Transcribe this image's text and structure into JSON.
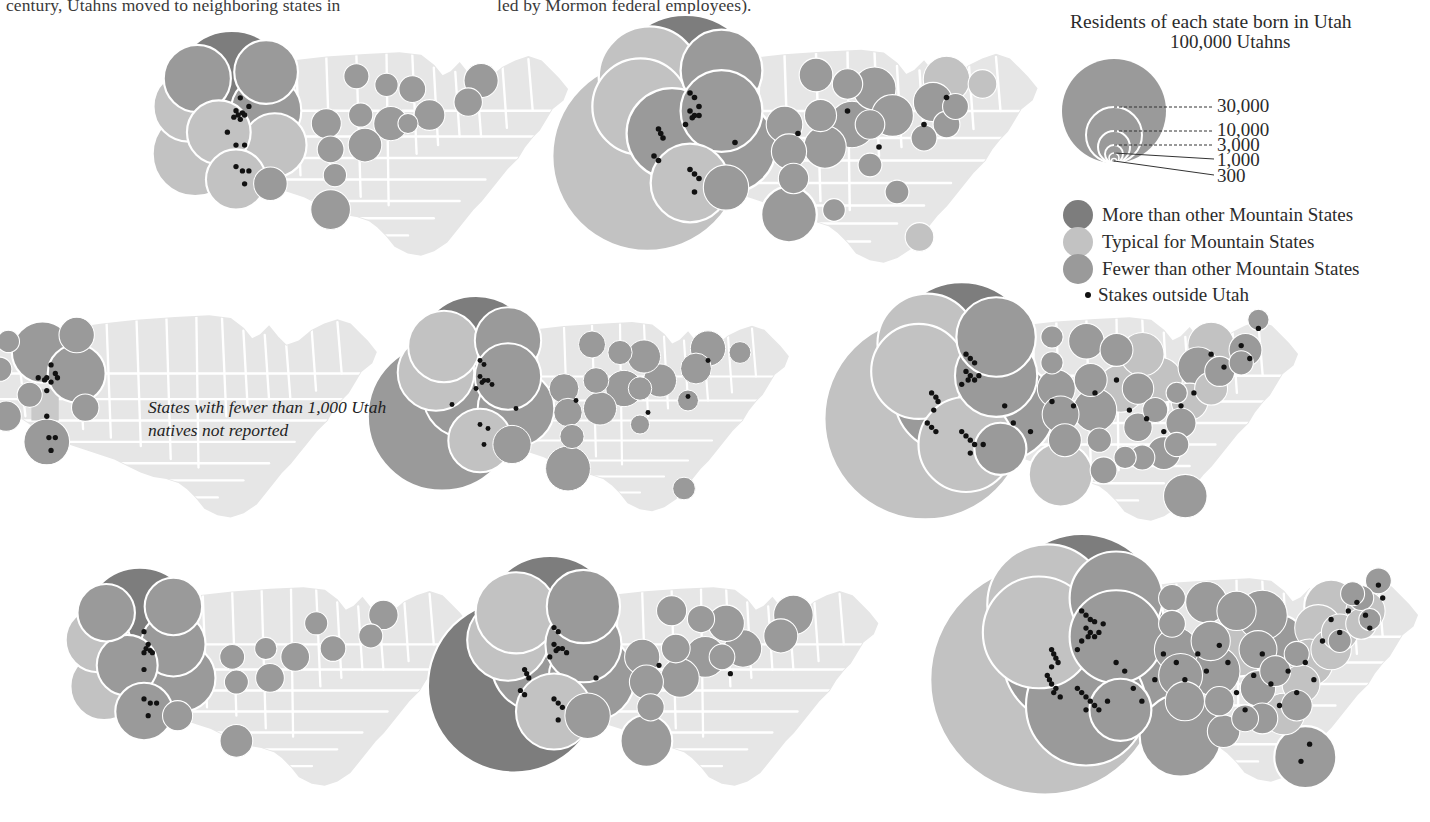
{
  "page": {
    "title": "Residents of each state born in Utah",
    "top_text_fragments": {
      "column_left": "century, Utahns moved to neighboring states in",
      "column_right": "led by Mormon federal employees)."
    },
    "map_note": "States with fewer than 1,000 Utah natives not reported"
  },
  "colors": {
    "background": "#ffffff",
    "map_base": "#e6e6e6",
    "map_border": "#ffffff",
    "utah_highlight": "#c9c9c9",
    "more": "#7d7d7d",
    "typical": "#c2c2c2",
    "fewer": "#9a9a9a",
    "stake_dot": "#111111",
    "text": "#2b2b2b"
  },
  "legend": {
    "title": "Residents of each state born in Utah",
    "top_label": "100,000 Utahns",
    "scale_values": [
      "100,000",
      "30,000",
      "10,000",
      "3,000",
      "1,000",
      "300"
    ],
    "scale_rings": [
      {
        "label": "30,000",
        "value": 30000
      },
      {
        "label": "10,000",
        "value": 10000
      },
      {
        "label": "3,000",
        "value": 3000
      },
      {
        "label": "1,000",
        "value": 1000
      },
      {
        "label": "300",
        "value": 300
      }
    ],
    "categories": [
      {
        "label": "More than other Mountain States",
        "color": "#7d7d7d",
        "key": "more"
      },
      {
        "label": "Typical for Mountain States",
        "color": "#c2c2c2",
        "key": "typical"
      },
      {
        "label": "Fewer than other Mountain States",
        "color": "#9a9a9a",
        "key": "fewer"
      }
    ],
    "stakes": {
      "label": "Stakes outside Utah",
      "marker": "dot"
    }
  },
  "chart_data": {
    "type": "map",
    "title": "Residents of each state born in Utah",
    "legend_scale": {
      "unit": "Utahns",
      "breaks": [
        100000,
        30000,
        10000,
        3000,
        1000,
        300
      ],
      "encoding": "circle area proportional to count, circles nested tangent at bottom"
    },
    "categories": [
      "More than other Mountain States",
      "Typical for Mountain States",
      "Fewer than other Mountain States"
    ],
    "annotation": "States with fewer than 1,000 Utah natives not reported",
    "panels": [
      {
        "row": 1,
        "col": 1,
        "index": 2,
        "note": ""
      },
      {
        "row": 1,
        "col": 2,
        "index": 3,
        "note": ""
      },
      {
        "row": 1,
        "col": 3,
        "index": 0,
        "note": "legend occupies this cell"
      },
      {
        "row": 2,
        "col": 1,
        "index": 1,
        "note": "States with fewer than 1,000 Utah natives not reported"
      },
      {
        "row": 2,
        "col": 2,
        "index": 4,
        "note": ""
      },
      {
        "row": 2,
        "col": 3,
        "index": 7,
        "note": ""
      },
      {
        "row": 3,
        "col": 1,
        "index": 5,
        "note": ""
      },
      {
        "row": 3,
        "col": 2,
        "index": 6,
        "note": ""
      },
      {
        "row": 3,
        "col": 3,
        "index": 8,
        "note": ""
      }
    ]
  }
}
